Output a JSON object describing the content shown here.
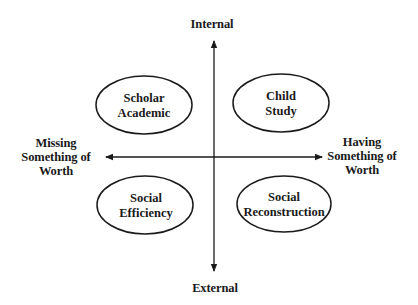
{
  "diagram": {
    "title": "",
    "axes": {
      "vertical": {
        "top_label": "Internal",
        "bottom_label": "External"
      },
      "horizontal": {
        "left_label_lines": [
          "Missing",
          "Something of",
          "Worth"
        ],
        "right_label_lines": [
          "Having",
          "Something of",
          "Worth"
        ]
      }
    },
    "quadrants": [
      {
        "id": "top-left",
        "lines": [
          "Scholar",
          "Academic"
        ]
      },
      {
        "id": "top-right",
        "lines": [
          "Child",
          "Study"
        ]
      },
      {
        "id": "bottom-left",
        "lines": [
          "Social",
          "Efficiency"
        ]
      },
      {
        "id": "bottom-right",
        "lines": [
          "Social",
          "Reconstruction"
        ]
      }
    ],
    "colors": {
      "stroke": "#1a1a1a",
      "background": "#ffffff"
    }
  }
}
